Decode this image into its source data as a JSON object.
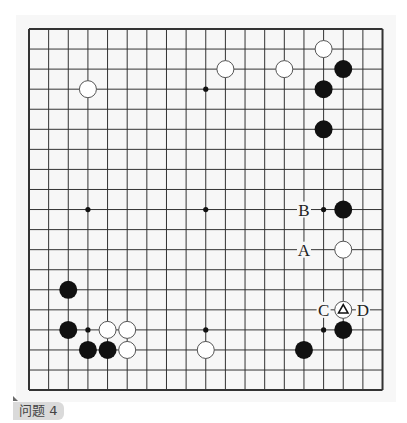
{
  "problem": {
    "caption": "问题 4"
  },
  "board": {
    "size": 19,
    "origin_x": 29,
    "origin_y": 29,
    "step_x": 19.64,
    "step_y": 20.06,
    "line_color": "#333333",
    "stone_radius": 9,
    "black_color": "#111111",
    "white_fill": "#ffffff",
    "white_stroke": "#555555",
    "star_points": [
      [
        3,
        3
      ],
      [
        9,
        3
      ],
      [
        15,
        3
      ],
      [
        3,
        9
      ],
      [
        9,
        9
      ],
      [
        15,
        9
      ],
      [
        3,
        15
      ],
      [
        9,
        15
      ],
      [
        15,
        15
      ]
    ],
    "stones": [
      {
        "color": "white",
        "col": 3,
        "row": 3
      },
      {
        "color": "white",
        "col": 10,
        "row": 2
      },
      {
        "color": "white",
        "col": 13,
        "row": 2
      },
      {
        "color": "white",
        "col": 15,
        "row": 1
      },
      {
        "color": "black",
        "col": 16,
        "row": 2
      },
      {
        "color": "black",
        "col": 15,
        "row": 3
      },
      {
        "color": "black",
        "col": 15,
        "row": 5
      },
      {
        "color": "black",
        "col": 16,
        "row": 9
      },
      {
        "color": "white",
        "col": 16,
        "row": 11
      },
      {
        "color": "white",
        "col": 16,
        "row": 14,
        "mark": "triangle"
      },
      {
        "color": "black",
        "col": 16,
        "row": 15
      },
      {
        "color": "black",
        "col": 14,
        "row": 16
      },
      {
        "color": "black",
        "col": 2,
        "row": 13
      },
      {
        "color": "black",
        "col": 2,
        "row": 15
      },
      {
        "color": "white",
        "col": 4,
        "row": 15
      },
      {
        "color": "white",
        "col": 5,
        "row": 15
      },
      {
        "color": "black",
        "col": 3,
        "row": 16
      },
      {
        "color": "black",
        "col": 4,
        "row": 16
      },
      {
        "color": "white",
        "col": 5,
        "row": 16
      },
      {
        "color": "white",
        "col": 9,
        "row": 16
      }
    ],
    "labels": [
      {
        "text": "B",
        "col": 14,
        "row": 9
      },
      {
        "text": "A",
        "col": 14,
        "row": 11
      },
      {
        "text": "C",
        "col": 15,
        "row": 14
      },
      {
        "text": "D",
        "col": 17,
        "row": 14
      }
    ]
  }
}
